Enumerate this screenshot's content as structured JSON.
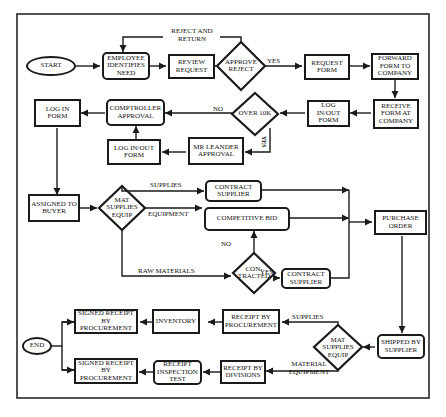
{
  "nodes": {
    "start": "START",
    "employee_identifies_need": "EMPLOYEE IDENTIFIES NEED",
    "review_request": "REVIEW REQUEST",
    "approve_reject": "APPROVE REJECT",
    "request_form": "REQUEST FORM",
    "forward_form": "FORWARD FORM TO COMPANY",
    "receive_form": "RECEIVE FORM AT COMPANY",
    "log_inout_form_1": "LOG IN/OUT FORM",
    "over_10k": "OVER 10K",
    "comptroller_approval": "COMPTROLLER APPROVAL",
    "log_in_form": "LOG IN FORM",
    "log_inout_form_2": "LOG IN/OUT FORM",
    "mr_leander_approval": "MR LEANDER APPROVAL",
    "assigned_to_buyer": "ASSIGNED TO BUYER",
    "mat_supplies_equip_1": "MAT SUPPLIES EQUIP",
    "contract_supplier_1": "CONTRACT SUPPLIER",
    "competitive_bid": "COMPETITIVE BID",
    "contracted": "CON- TRACTED",
    "contract_supplier_2": "CONTRACT SUPPLIER",
    "purchase_order": "PURCHASE ORDER",
    "shipped_by_supplier": "SHIPPED BY SUPPLIER",
    "mat_supplies_equip_2": "MAT SUPPLIES EQUIP",
    "receipt_by_procurement": "RECEIPT BY PROCUREMENT",
    "inventory": "INVENTORY",
    "signed_receipt_1": "SIGNED RECEIPT BY PROCUREMENT",
    "receipt_by_divisions": "RECEIPT BY DIVISIONS",
    "receipt_inspection_test": "RECEIPT INSPECTION TEST",
    "signed_receipt_2": "SIGNED RECEIPT BY PROCUREMENT",
    "end": "END"
  },
  "edge_labels": {
    "reject_and_return": "REJECT AND RETURN",
    "yes_approve": "YES",
    "no_over10k": "NO",
    "yes_over10k": "YES",
    "supplies_1": "SUPPLIES",
    "equipment": "EQUIPMENT",
    "raw_materials": "RAW MATERIALS",
    "no_contracted": "NO",
    "yes_contracted": "YES",
    "supplies_2": "SUPPLIES",
    "material_equipment": "MATERIAL EQUIPMENT"
  }
}
